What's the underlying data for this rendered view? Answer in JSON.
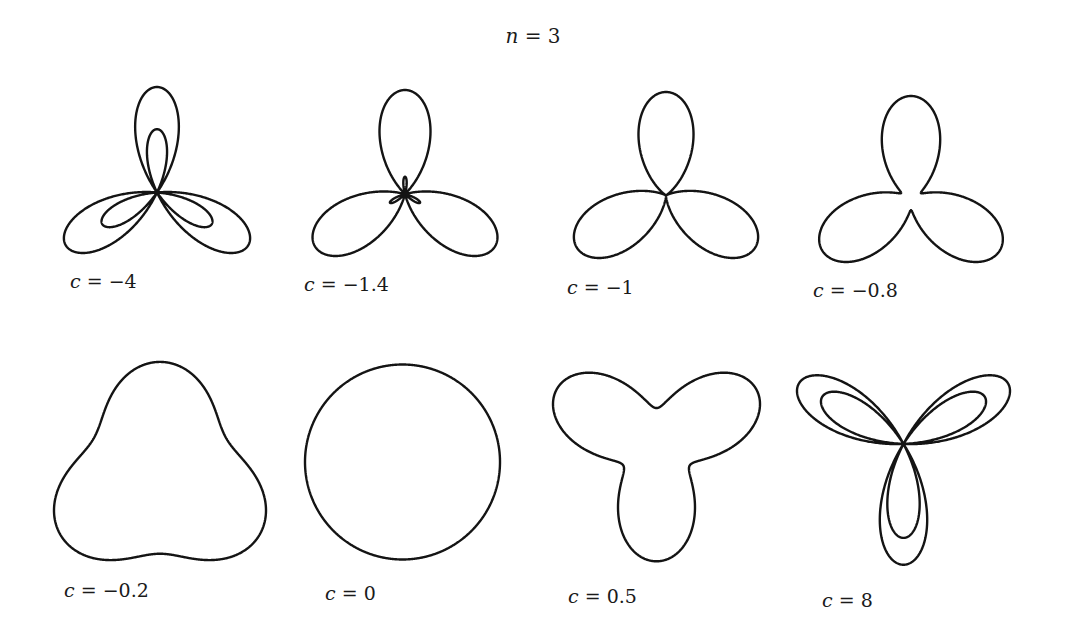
{
  "title": {
    "var": "n",
    "eq": " = ",
    "value": "3"
  },
  "chart_data": {
    "type": "polar-curves",
    "title": "n = 3",
    "formula": "r = 1 + c·sin(nθ)",
    "n": 3,
    "grid": false,
    "panels": [
      {
        "c": -4,
        "label": "c = −4",
        "bbox": [
          52,
          87,
          262,
          253
        ],
        "label_pos": [
          110,
          284
        ]
      },
      {
        "c": -1.4,
        "label": "c = −1.4",
        "bbox": [
          300,
          90,
          510,
          256
        ],
        "label_pos": [
          344,
          287
        ]
      },
      {
        "c": -1,
        "label": "c = −1",
        "bbox": [
          562,
          92,
          770,
          258
        ],
        "label_pos": [
          607,
          290
        ]
      },
      {
        "c": -0.8,
        "label": "c = −0.8",
        "bbox": [
          808,
          96,
          1014,
          262
        ],
        "label_pos": [
          853,
          293
        ]
      },
      {
        "c": -0.2,
        "label": "c = −0.2",
        "bbox": [
          54,
          360,
          266,
          562
        ],
        "label_pos": [
          104,
          593
        ]
      },
      {
        "c": 0,
        "label": "c = 0",
        "bbox": [
          305,
          362,
          500,
          562
        ],
        "label_pos": [
          365,
          596
        ]
      },
      {
        "c": 0.5,
        "label": "c = 0.5",
        "bbox": [
          553,
          370,
          760,
          564
        ],
        "label_pos": [
          608,
          599
        ]
      },
      {
        "c": 8,
        "label": "c = 8",
        "bbox": [
          797,
          372,
          1010,
          568
        ],
        "label_pos": [
          862,
          603
        ]
      }
    ]
  },
  "labels": {
    "p0": {
      "var": "c",
      "rest": " = −4"
    },
    "p1": {
      "var": "c",
      "rest": " = −1.4"
    },
    "p2": {
      "var": "c",
      "rest": " = −1"
    },
    "p3": {
      "var": "c",
      "rest": " = −0.8"
    },
    "p4": {
      "var": "c",
      "rest": " = −0.2"
    },
    "p5": {
      "var": "c",
      "rest": " = 0"
    },
    "p6": {
      "var": "c",
      "rest": " = 0.5"
    },
    "p7": {
      "var": "c",
      "rest": " = 8"
    }
  },
  "colors": {
    "stroke": "#141414",
    "background": "#ffffff"
  }
}
